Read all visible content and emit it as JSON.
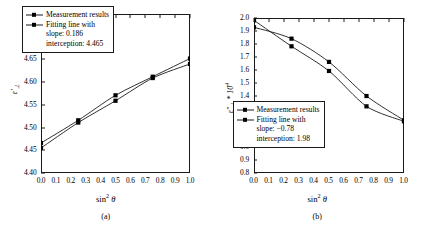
{
  "figure": {
    "background": "#ffffff",
    "line_color": "#1a1a1a",
    "marker_color": "#000000"
  },
  "panels": [
    {
      "caption": "(a)",
      "xlabel_main": "sin",
      "xlabel_sup": "2",
      "xlabel_theta": "θ",
      "ylabel": "ε'⊥",
      "legend": {
        "series1": "Measurement results",
        "series2": "Fitting line with",
        "line3": "slope: 0.186",
        "line4": "interception: 4.465"
      }
    },
    {
      "caption": "(b)",
      "xlabel_main": "sin",
      "xlabel_sup": "2",
      "xlabel_theta": "θ",
      "ylabel": "ε''⊥ * 10⁴",
      "legend": {
        "series1": "Measurement results",
        "series2": "Fitting line with",
        "line3": "slope: −0.78",
        "line4": "interception: 1.98"
      }
    }
  ],
  "chart_data": [
    {
      "type": "line",
      "panel": "a",
      "title": "",
      "xlabel": "sin^2 θ",
      "ylabel": "ε'⊥",
      "xlim": [
        0.0,
        1.0
      ],
      "ylim": [
        4.4,
        4.75
      ],
      "xticks": [
        "0.0",
        "0.1",
        "0.2",
        "0.3",
        "0.4",
        "0.5",
        "0.6",
        "0.7",
        "0.8",
        "0.9",
        "1.0"
      ],
      "xtick_values": [
        0.0,
        0.1,
        0.2,
        0.3,
        0.4,
        0.5,
        0.6,
        0.7,
        0.8,
        0.9,
        1.0
      ],
      "yticks": [
        "4.40",
        "4.45",
        "4.50",
        "4.55",
        "4.60",
        "4.65",
        "4.70",
        "4.75"
      ],
      "ytick_values": [
        4.4,
        4.45,
        4.5,
        4.55,
        4.6,
        4.65,
        4.7,
        4.75
      ],
      "grid": false,
      "legend_position": "upper-left-inside",
      "x": [
        0.0,
        0.25,
        0.5,
        0.75,
        1.0
      ],
      "series": [
        {
          "name": "Measurement results",
          "values": [
            4.466,
            4.516,
            4.571,
            4.612,
            4.652
          ]
        },
        {
          "name": "Fitting line with",
          "values": [
            4.455,
            4.511,
            4.559,
            4.609,
            4.64
          ]
        }
      ],
      "fit_slope": 0.186,
      "fit_interception": 4.465
    },
    {
      "type": "line",
      "panel": "b",
      "title": "",
      "xlabel": "sin^2 θ",
      "ylabel": "ε''⊥ * 10^4",
      "xlim": [
        0.0,
        1.0
      ],
      "ylim": [
        0.8,
        2.0
      ],
      "xticks": [
        "0.0",
        "0.1",
        "0.2",
        "0.3",
        "0.4",
        "0.5",
        "0.6",
        "0.7",
        "0.8",
        "0.9",
        "1.0"
      ],
      "xtick_values": [
        0.0,
        0.1,
        0.2,
        0.3,
        0.4,
        0.5,
        0.6,
        0.7,
        0.8,
        0.9,
        1.0
      ],
      "yticks": [
        "0.8",
        "0.9",
        "1.0",
        "1.1",
        "1.2",
        "1.3",
        "1.4",
        "1.5",
        "1.6",
        "1.7",
        "1.8",
        "1.9",
        "2.0"
      ],
      "ytick_values": [
        0.8,
        0.9,
        1.0,
        1.1,
        1.2,
        1.3,
        1.4,
        1.5,
        1.6,
        1.7,
        1.8,
        1.9,
        2.0
      ],
      "grid": false,
      "legend_position": "lower-left-inside",
      "x": [
        0.0,
        0.25,
        0.5,
        0.75,
        1.0
      ],
      "series": [
        {
          "name": "Measurement results",
          "values": [
            1.928,
            1.84,
            1.66,
            1.396,
            1.208
          ]
        },
        {
          "name": "Fitting line with",
          "values": [
            1.982,
            1.781,
            1.59,
            1.316,
            1.2
          ]
        }
      ],
      "fit_slope": -0.78,
      "fit_interception": 1.98
    }
  ]
}
